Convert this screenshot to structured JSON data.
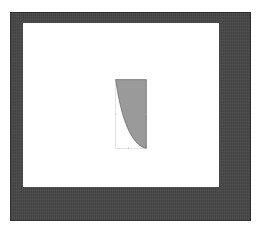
{
  "image": {
    "kind": "scanned-figure",
    "width": 258,
    "height": 229,
    "background_color": "#ffffff"
  },
  "frame": {
    "name": "photo-border",
    "color": "#484848",
    "texture": "mottled-grain",
    "left": 10,
    "top": 12,
    "width": 241,
    "height": 209
  },
  "plate": {
    "name": "white-canvas",
    "color": "#ffffff",
    "left": 23,
    "top": 23,
    "width": 196,
    "height": 164
  },
  "chart_data": {
    "type": "area",
    "title": "",
    "subtitle": "",
    "xlabel": "",
    "ylabel": "",
    "xlim": [
      0,
      1
    ],
    "ylim": [
      0,
      1
    ],
    "grid": false,
    "legend": null,
    "legend_position": "none",
    "annotations": [],
    "tick_labels": {
      "x": [],
      "y": []
    },
    "shape": {
      "name": "shaded-region",
      "fill_color": "#9a9a9a",
      "fill_texture": "fine-vertical-stripes",
      "stroke_color": "#5a5a5a",
      "stroke_width": 1,
      "outline_rect_color": "#c8c8c8",
      "arc_start": [
        0.0,
        1.0
      ],
      "arc_end": [
        1.0,
        0.0
      ],
      "arc_control": [
        0.18,
        0.18
      ],
      "vertices": [
        [
          0.0,
          1.0
        ],
        [
          1.0,
          1.0
        ],
        [
          1.0,
          0.0
        ]
      ]
    },
    "series": [
      {
        "name": "region",
        "x": [
          0.0,
          0.1,
          0.2,
          0.3,
          0.4,
          0.5,
          0.6,
          0.7,
          0.8,
          0.9,
          1.0
        ],
        "values": [
          1.0,
          0.96,
          0.89,
          0.81,
          0.71,
          0.6,
          0.49,
          0.37,
          0.25,
          0.13,
          0.0
        ]
      }
    ],
    "ticks": [
      {
        "name": "tick-left-mid",
        "x": 0.0,
        "y": 0.5
      },
      {
        "name": "tick-right-mid",
        "x": 1.0,
        "y": 0.5
      },
      {
        "name": "tick-bottom-mid",
        "x": 0.42,
        "y": 0.0
      }
    ]
  }
}
